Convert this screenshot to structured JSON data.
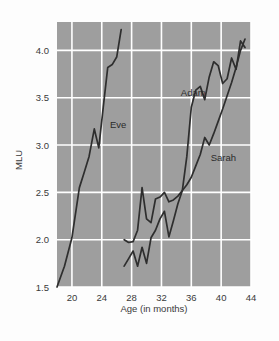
{
  "chart_data": {
    "type": "line",
    "title": "",
    "xlabel": "Age (in months)",
    "ylabel": "MLU",
    "xlim": [
      18,
      44
    ],
    "ylim": [
      1.5,
      4.3
    ],
    "xticks": [
      20,
      24,
      28,
      32,
      36,
      40,
      44
    ],
    "yticks": [
      1.5,
      2.0,
      2.5,
      3.0,
      3.5,
      4.0
    ],
    "xtick_labels": [
      "20",
      "24",
      "28",
      "32",
      "36",
      "40",
      "44"
    ],
    "ytick_labels": [
      "1.5",
      "2.0",
      "2.5",
      "3.0",
      "3.5",
      "4.0"
    ],
    "grid": true,
    "legend_position": "inline-annotations",
    "plot_background": "#9e9e9e",
    "gridline_color": "#ffffff",
    "line_color": "#2e2e2e",
    "series": [
      {
        "name": "Eve",
        "label": "Eve",
        "label_x": 25.1,
        "label_y": 3.18,
        "x": [
          18.0,
          19.0,
          20.0,
          21.0,
          21.6,
          22.3,
          23.0,
          23.6,
          24.2,
          24.8,
          25.4,
          26.0,
          26.6
        ],
        "y": [
          1.5,
          1.72,
          2.02,
          2.55,
          2.7,
          2.88,
          3.17,
          2.97,
          3.4,
          3.82,
          3.85,
          3.93,
          4.22
        ]
      },
      {
        "name": "Adam",
        "label": "Adam",
        "label_x": 34.6,
        "label_y": 3.52,
        "x": [
          27.0,
          27.6,
          28.2,
          28.8,
          29.4,
          30.0,
          30.6,
          31.2,
          31.8,
          32.4,
          33.0,
          33.6,
          34.2,
          34.8,
          35.4,
          36.0,
          36.6,
          37.2,
          37.8,
          38.4,
          39.0,
          39.6,
          40.2,
          40.8,
          41.4,
          42.0,
          42.6,
          43.2
        ],
        "y": [
          2.0,
          1.97,
          1.98,
          2.1,
          2.55,
          2.22,
          2.18,
          2.43,
          2.45,
          2.5,
          2.4,
          2.42,
          2.46,
          2.52,
          2.88,
          3.4,
          3.58,
          3.62,
          3.48,
          3.72,
          3.88,
          3.84,
          3.65,
          3.7,
          3.92,
          3.8,
          4.1,
          4.03
        ]
      },
      {
        "name": "Sarah",
        "label": "Sarah",
        "label_x": 38.6,
        "label_y": 2.83,
        "x": [
          27.0,
          27.6,
          28.2,
          28.8,
          29.4,
          30.0,
          30.6,
          31.2,
          31.8,
          32.4,
          33.0,
          33.6,
          34.2,
          34.8,
          35.4,
          36.0,
          36.6,
          37.2,
          37.8,
          38.4,
          39.0,
          39.6,
          40.2,
          40.8,
          41.4,
          42.0,
          42.6,
          43.2
        ],
        "y": [
          1.72,
          1.8,
          1.88,
          1.72,
          1.92,
          1.75,
          2.02,
          2.1,
          2.22,
          2.3,
          2.03,
          2.2,
          2.38,
          2.52,
          2.58,
          2.66,
          2.78,
          2.9,
          3.08,
          3.0,
          3.12,
          3.25,
          3.38,
          3.52,
          3.66,
          3.82,
          4.0,
          4.12
        ]
      }
    ]
  },
  "axes": {
    "y_axis_title": "MLU",
    "x_axis_title": "Age (in months)"
  }
}
